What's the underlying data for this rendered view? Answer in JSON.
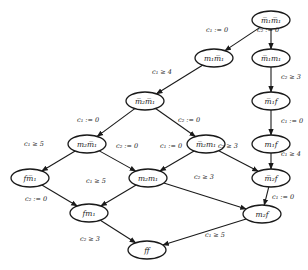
{
  "diagram": {
    "type": "state-transition-graph",
    "nodes": [
      {
        "id": "n0",
        "label": "m̅₁m̅₁",
        "x": 271,
        "y": 20
      },
      {
        "id": "n1",
        "label": "m₁m̅₁",
        "x": 214,
        "y": 58
      },
      {
        "id": "n2",
        "label": "m̅₁m₁",
        "x": 271,
        "y": 58
      },
      {
        "id": "n3",
        "label": "m̅₂m̅₁",
        "x": 145,
        "y": 101
      },
      {
        "id": "n4",
        "label": "m̅₁f",
        "x": 271,
        "y": 101
      },
      {
        "id": "n5",
        "label": "m₂m̅₁",
        "x": 87,
        "y": 144
      },
      {
        "id": "n6",
        "label": "m̅₂m₁",
        "x": 206,
        "y": 144
      },
      {
        "id": "n7",
        "label": "m₁f",
        "x": 271,
        "y": 144
      },
      {
        "id": "n8",
        "label": "fm̅₁",
        "x": 30,
        "y": 178
      },
      {
        "id": "n9",
        "label": "m₂m₁",
        "x": 148,
        "y": 178
      },
      {
        "id": "n10",
        "label": "m̅₂f",
        "x": 271,
        "y": 178
      },
      {
        "id": "n11",
        "label": "fm₁",
        "x": 89,
        "y": 213
      },
      {
        "id": "n12",
        "label": "m₂f",
        "x": 262,
        "y": 214
      },
      {
        "id": "n13",
        "label": "ff",
        "x": 147,
        "y": 250
      }
    ],
    "edges": [
      {
        "from": "n0",
        "to": "n1",
        "label": "c₁ := 0",
        "lx": 206,
        "ly": 32
      },
      {
        "from": "n0",
        "to": "n2",
        "label": "c₂ := 0",
        "lx": 257,
        "ly": 32
      },
      {
        "from": "n1",
        "to": "n3",
        "label": "c₁ ≥ 4",
        "lx": 152,
        "ly": 74
      },
      {
        "from": "n2",
        "to": "n4",
        "label": "c₂ ≥ 3",
        "lx": 281,
        "ly": 79
      },
      {
        "from": "n3",
        "to": "n5",
        "label": "c₁ := 0",
        "lx": 77,
        "ly": 122
      },
      {
        "from": "n3",
        "to": "n6",
        "label": "c₂ := 0",
        "lx": 178,
        "ly": 122
      },
      {
        "from": "n4",
        "to": "n7",
        "label": "c₁ := 0",
        "lx": 281,
        "ly": 123
      },
      {
        "from": "n5",
        "to": "n8",
        "label": "c₁ ≥ 5",
        "lx": 24,
        "ly": 146
      },
      {
        "from": "n5",
        "to": "n9",
        "label": "c₂ := 0",
        "lx": 116,
        "ly": 148
      },
      {
        "from": "n6",
        "to": "n9",
        "label": "c₁ := 0",
        "lx": 160,
        "ly": 148
      },
      {
        "from": "n6",
        "to": "n10",
        "label": "c₂ ≥ 3",
        "lx": 218,
        "ly": 148
      },
      {
        "from": "n7",
        "to": "n10",
        "label": "c₁ ≥ 4",
        "lx": 281,
        "ly": 156
      },
      {
        "from": "n8",
        "to": "n11",
        "label": "c₂ := 0",
        "lx": 25,
        "ly": 201
      },
      {
        "from": "n9",
        "to": "n11",
        "label": "c₁ ≥ 5",
        "lx": 86,
        "ly": 183
      },
      {
        "from": "n9",
        "to": "n12",
        "label": "c₂ ≥ 3",
        "lx": 194,
        "ly": 179
      },
      {
        "from": "n10",
        "to": "n12",
        "label": "c₁ := 0",
        "lx": 272,
        "ly": 199
      },
      {
        "from": "n11",
        "to": "n13",
        "label": "c₂ ≥ 3",
        "lx": 80,
        "ly": 241
      },
      {
        "from": "n12",
        "to": "n13",
        "label": "c₁ ≥ 5",
        "lx": 205,
        "ly": 237
      }
    ]
  }
}
